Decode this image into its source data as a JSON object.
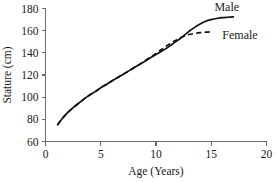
{
  "chart_data": {
    "type": "line",
    "title": "",
    "xlabel": "Age (Years)",
    "ylabel": "Stature (cm)",
    "xlim": [
      0,
      20
    ],
    "ylim": [
      60,
      180
    ],
    "xticks": [
      0,
      5,
      10,
      15,
      20
    ],
    "yticks": [
      60,
      80,
      100,
      120,
      140,
      160,
      180
    ],
    "xtick_labels": [
      "0",
      "5",
      "10",
      "15",
      "20"
    ],
    "ytick_labels": [
      "60",
      "80",
      "100",
      "120",
      "140",
      "160",
      "180"
    ],
    "grid": false,
    "legend_position": "inline-right",
    "series": [
      {
        "name": "Male",
        "style": "solid",
        "color": "#111111",
        "x": [
          1.1,
          1.5,
          2,
          2.5,
          3,
          3.5,
          4,
          4.5,
          5,
          5.5,
          6,
          6.5,
          7,
          7.5,
          8,
          8.5,
          9,
          9.5,
          10,
          10.5,
          11,
          11.5,
          12,
          12.5,
          13,
          13.5,
          14,
          14.5,
          15,
          15.5,
          16,
          16.5,
          17
        ],
        "y": [
          75,
          80.5,
          86,
          90.5,
          94.5,
          98.5,
          102,
          105,
          108.5,
          111.5,
          114.5,
          117.5,
          120.5,
          123.5,
          126.5,
          129.5,
          132.5,
          135.5,
          138.5,
          141.5,
          144.5,
          148,
          151.5,
          155.5,
          159.5,
          163,
          166,
          168.5,
          170,
          171,
          171.7,
          172.1,
          172.4
        ]
      },
      {
        "name": "Female",
        "style": "dashed",
        "color": "#111111",
        "x": [
          1.1,
          1.5,
          2,
          2.5,
          3,
          3.5,
          4,
          4.5,
          5,
          5.5,
          6,
          6.5,
          7,
          7.5,
          8,
          8.5,
          9,
          9.5,
          10,
          10.5,
          11,
          11.5,
          12,
          12.5,
          13,
          13.5,
          14,
          14.5,
          15
        ],
        "y": [
          75,
          80.5,
          86,
          90.5,
          94.5,
          98.5,
          102,
          105,
          108.5,
          111.5,
          114.5,
          117.5,
          120.5,
          123.5,
          126.5,
          129.5,
          132.8,
          136,
          139.5,
          143,
          146.5,
          149.5,
          152.5,
          154.8,
          156.5,
          157.5,
          158.2,
          158.6,
          158.9
        ]
      }
    ],
    "annotations": [
      {
        "text": "Male",
        "x": 16.4,
        "y": 177.5,
        "anchor": "middle"
      },
      {
        "text": "Female",
        "x": 17.6,
        "y": 152.5,
        "anchor": "middle"
      }
    ]
  }
}
